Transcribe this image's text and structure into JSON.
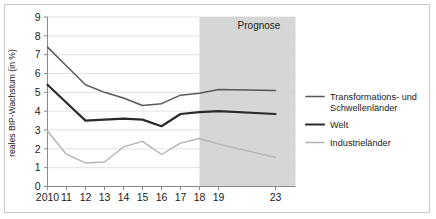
{
  "figure": {
    "forecast_label": "Prognose",
    "background": "#ffffff",
    "border_color": "#c9c9c9",
    "forecast_band_color": "#d2d2d2"
  },
  "axes": {
    "ylabel": "reales BIP-Wachstum (in %)",
    "ytick_labels": [
      "0",
      "1",
      "2",
      "3",
      "4",
      "5",
      "6",
      "7",
      "8",
      "9"
    ],
    "xtick_labels": [
      "2010",
      "11",
      "12",
      "13",
      "14",
      "15",
      "16",
      "17",
      "18",
      "19",
      "23"
    ]
  },
  "legend": {
    "items": [
      {
        "label_line1": "Transformations- und",
        "label_line2": "Schwellenländer",
        "color": "#58585a"
      },
      {
        "label_line1": "Welt",
        "label_line2": "",
        "color": "#2b2b2b"
      },
      {
        "label_line1": "Industrieländer",
        "label_line2": "",
        "color": "#b3b3b3"
      }
    ]
  },
  "chart_data": {
    "type": "line",
    "title": "",
    "xlabel": "",
    "ylabel": "reales BIP-Wachstum (in %)",
    "ylim": [
      0,
      9
    ],
    "grid": true,
    "legend_position": "right",
    "categories": [
      "2010",
      "11",
      "12",
      "13",
      "14",
      "15",
      "16",
      "17",
      "18",
      "19",
      "23"
    ],
    "annotations": [
      {
        "text": "Prognose",
        "from_category": "18",
        "to_category": "23",
        "kind": "shaded-band"
      }
    ],
    "series": [
      {
        "name": "Transformations- und Schwellenländer",
        "color": "#58585a",
        "values": [
          7.4,
          6.4,
          5.4,
          5.0,
          4.7,
          4.3,
          4.4,
          4.85,
          4.95,
          5.15,
          5.1
        ]
      },
      {
        "name": "Welt",
        "color": "#2b2b2b",
        "values": [
          5.4,
          4.45,
          3.5,
          3.55,
          3.6,
          3.55,
          3.2,
          3.85,
          3.95,
          4.0,
          3.85
        ]
      },
      {
        "name": "Industrieländer",
        "color": "#b3b3b3",
        "values": [
          2.95,
          1.7,
          1.25,
          1.3,
          2.1,
          2.4,
          1.7,
          2.3,
          2.55,
          2.25,
          1.55
        ]
      }
    ]
  }
}
